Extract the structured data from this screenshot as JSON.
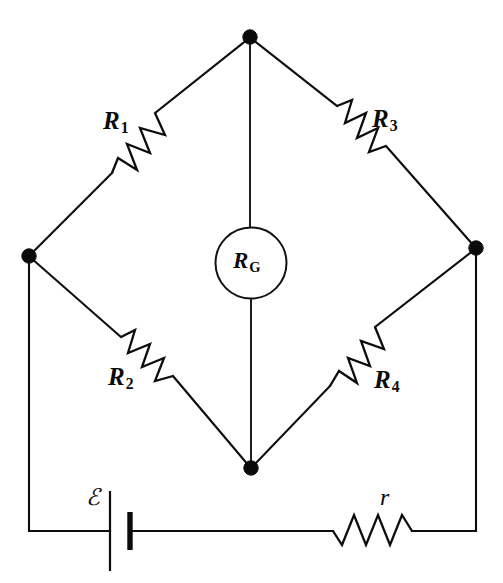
{
  "figure": {
    "background_color": "#ffffff",
    "line_color": "#0d0d0d",
    "width": 503,
    "height": 583
  },
  "labels": {
    "r1": {
      "symbol": "R",
      "subscript": "1"
    },
    "r2": {
      "symbol": "R",
      "subscript": "2"
    },
    "r3": {
      "symbol": "R",
      "subscript": "3"
    },
    "r4": {
      "symbol": "R",
      "subscript": "4"
    },
    "rg": {
      "symbol": "R",
      "subscript": "G"
    },
    "emf": {
      "symbol": "ℰ"
    },
    "r_internal": {
      "symbol": "r"
    }
  },
  "components": [
    {
      "name": "resistor-r1",
      "kind": "resistor",
      "label": "R₁",
      "branch": "top-left"
    },
    {
      "name": "resistor-r3",
      "kind": "resistor",
      "label": "R₃",
      "branch": "top-right"
    },
    {
      "name": "resistor-r2",
      "kind": "resistor",
      "label": "R₂",
      "branch": "bottom-left"
    },
    {
      "name": "resistor-r4",
      "kind": "resistor",
      "label": "R₄",
      "branch": "bottom-right"
    },
    {
      "name": "galvanometer-rg",
      "kind": "galvanometer",
      "label": "R_G",
      "branch": "bridge-center"
    },
    {
      "name": "battery-emf",
      "kind": "battery",
      "label": "ℰ",
      "branch": "bottom-rail-left"
    },
    {
      "name": "resistor-r-internal",
      "kind": "resistor",
      "label": "r",
      "branch": "bottom-rail-right"
    }
  ],
  "nodes": [
    {
      "name": "node-top",
      "x": 250,
      "y": 37
    },
    {
      "name": "node-left",
      "x": 29,
      "y": 256
    },
    {
      "name": "node-right",
      "x": 476,
      "y": 248
    },
    {
      "name": "node-bottom",
      "x": 251,
      "y": 468
    }
  ]
}
